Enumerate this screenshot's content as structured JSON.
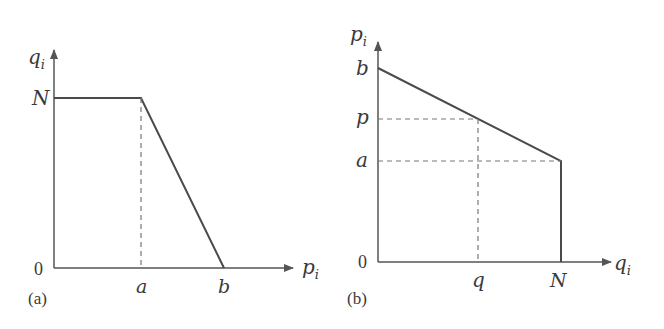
{
  "panel_a": {
    "caption": "(a)",
    "y_axis_label": "q",
    "y_axis_sub": "i",
    "x_axis_label": "p",
    "x_axis_sub": "i",
    "origin_label": "0",
    "y_tick_labels": [
      "N"
    ],
    "x_tick_labels": [
      "a",
      "b"
    ]
  },
  "panel_b": {
    "caption": "(b)",
    "y_axis_label": "p",
    "y_axis_sub": "i",
    "x_axis_label": "q",
    "x_axis_sub": "i",
    "origin_label": "0",
    "y_tick_labels": [
      "b",
      "p",
      "a"
    ],
    "x_tick_labels": [
      "q",
      "N"
    ]
  },
  "colors": {
    "line": "#4a4a4a",
    "axis": "#555555",
    "dashed": "#777777",
    "text": "#3a3a3a",
    "background": "#ffffff"
  }
}
